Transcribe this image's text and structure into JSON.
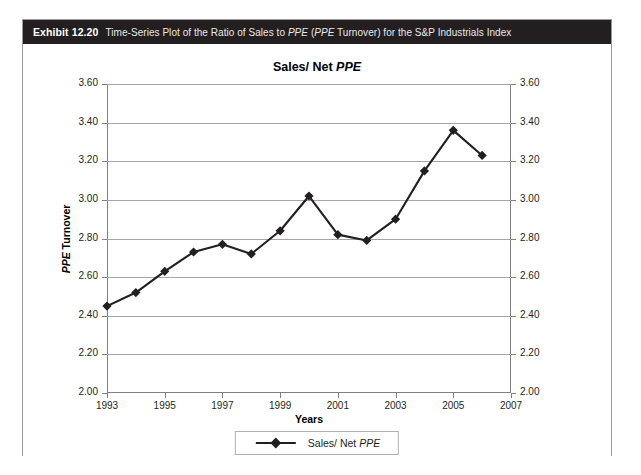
{
  "exhibit": {
    "number": "Exhibit 12.20",
    "caption_part1": "Time-Series Plot of the Ratio of Sales to ",
    "caption_ppe1": "PPE",
    "caption_part2": " (",
    "caption_ppe2": "PPE",
    "caption_part3": " Turnover) for the S&P Industrials Index",
    "header_bg": "#231f20"
  },
  "chart_data": {
    "type": "line",
    "title_prefix": "Sales/ Net ",
    "title_italic": "PPE",
    "title": "Sales/ Net PPE",
    "xlabel": "Years",
    "ylabel_prefix": "",
    "ylabel_italic": "PPE",
    "ylabel_suffix": " Turnover",
    "ylabel": "PPE Turnover",
    "x": [
      1993,
      1994,
      1995,
      1996,
      1997,
      1998,
      1999,
      2000,
      2001,
      2002,
      2003,
      2004,
      2005,
      2006
    ],
    "values": [
      2.45,
      2.52,
      2.63,
      2.73,
      2.77,
      2.72,
      2.84,
      3.02,
      2.82,
      2.79,
      2.9,
      3.15,
      3.36,
      3.23
    ],
    "series": [
      {
        "name": "Sales/ Net PPE",
        "values": [
          2.45,
          2.52,
          2.63,
          2.73,
          2.77,
          2.72,
          2.84,
          3.02,
          2.82,
          2.79,
          2.9,
          3.15,
          3.36,
          3.23
        ]
      }
    ],
    "xlim": [
      1993,
      2007
    ],
    "ylim": [
      2.0,
      3.6
    ],
    "ytick_step": 0.2,
    "yticks": [
      "3.60",
      "3.40",
      "3.20",
      "3.00",
      "2.80",
      "2.60",
      "2.40",
      "2.20",
      "2.00"
    ],
    "xticks": [
      "1993",
      "1995",
      "1997",
      "1999",
      "2001",
      "2003",
      "2005",
      "2007"
    ],
    "grid": true,
    "dual_y_axis": true,
    "legend_position": "bottom",
    "legend": [
      {
        "label_prefix": "Sales/ Net ",
        "label_italic": "PPE",
        "label": "Sales/ Net PPE",
        "marker": "diamond",
        "color": "#231f20"
      }
    ],
    "line_color": "#231f20",
    "marker_color": "#231f20"
  }
}
